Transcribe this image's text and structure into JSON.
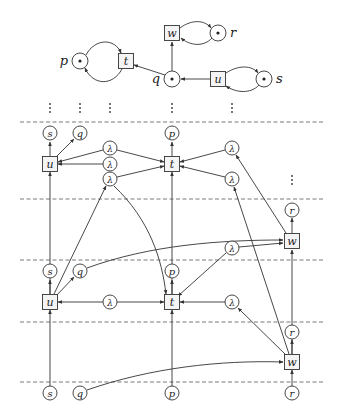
{
  "colors": {
    "stroke": "#333333",
    "fill": "#ffffff",
    "node_fill": "#f4f4f4",
    "dash": "#555555"
  },
  "top_net": {
    "places": [
      {
        "id": "p",
        "label": "p",
        "x": 80,
        "y": 61,
        "token": true,
        "label_side": "left"
      },
      {
        "id": "q",
        "label": "q",
        "x": 172,
        "y": 79,
        "token": true,
        "label_side": "left"
      },
      {
        "id": "r",
        "label": "r",
        "x": 218,
        "y": 33,
        "token": true,
        "label_side": "right"
      },
      {
        "id": "s",
        "label": "s",
        "x": 264,
        "y": 79,
        "token": true,
        "label_side": "right"
      }
    ],
    "transitions": [
      {
        "id": "t",
        "label": "t",
        "x": 126,
        "y": 61
      },
      {
        "id": "w",
        "label": "w",
        "x": 172,
        "y": 33
      },
      {
        "id": "u",
        "label": "u",
        "x": 218,
        "y": 79
      }
    ]
  },
  "ellipsis_marks": [
    {
      "x": 50,
      "y": 108
    },
    {
      "x": 80,
      "y": 108
    },
    {
      "x": 110,
      "y": 108
    },
    {
      "x": 172,
      "y": 108
    },
    {
      "x": 232,
      "y": 108
    },
    {
      "x": 292,
      "y": 180
    }
  ],
  "dashed_lines": [
    122,
    199,
    260,
    322,
    382
  ],
  "unfolding": {
    "places": [
      {
        "label": "s",
        "x": 50,
        "y": 133
      },
      {
        "label": "q",
        "x": 80,
        "y": 133
      },
      {
        "label": "p",
        "x": 172,
        "y": 133
      },
      {
        "label": "λ",
        "x": 110,
        "y": 148
      },
      {
        "label": "λ",
        "x": 110,
        "y": 164
      },
      {
        "label": "λ",
        "x": 110,
        "y": 179
      },
      {
        "label": "λ",
        "x": 232,
        "y": 148
      },
      {
        "label": "λ",
        "x": 232,
        "y": 179
      },
      {
        "label": "r",
        "x": 292,
        "y": 210
      },
      {
        "label": "λ",
        "x": 232,
        "y": 248
      },
      {
        "label": "s",
        "x": 50,
        "y": 271
      },
      {
        "label": "q",
        "x": 80,
        "y": 271
      },
      {
        "label": "p",
        "x": 172,
        "y": 271
      },
      {
        "label": "λ",
        "x": 110,
        "y": 302
      },
      {
        "label": "λ",
        "x": 232,
        "y": 302
      },
      {
        "label": "r",
        "x": 292,
        "y": 332
      },
      {
        "label": "s",
        "x": 50,
        "y": 393
      },
      {
        "label": "q",
        "x": 80,
        "y": 393
      },
      {
        "label": "p",
        "x": 172,
        "y": 393
      },
      {
        "label": "r",
        "x": 292,
        "y": 393
      }
    ],
    "transitions": [
      {
        "label": "u",
        "x": 50,
        "y": 164
      },
      {
        "label": "t",
        "x": 172,
        "y": 164
      },
      {
        "label": "w",
        "x": 292,
        "y": 241
      },
      {
        "label": "u",
        "x": 50,
        "y": 302
      },
      {
        "label": "t",
        "x": 172,
        "y": 302
      },
      {
        "label": "w",
        "x": 292,
        "y": 362
      }
    ]
  }
}
